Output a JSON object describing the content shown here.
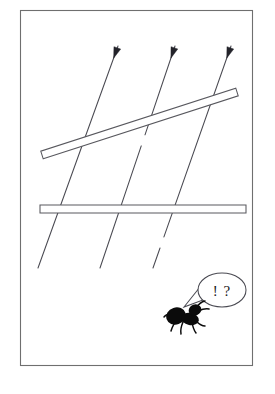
{
  "figure": {
    "background_color": "#ffffff",
    "frame": {
      "name": "illustration-border",
      "x": 20,
      "y": 10,
      "width": 232,
      "height": 355,
      "stroke_color": "#6f6f6f",
      "fill_color": "#ffffff"
    },
    "rays": {
      "count": 3,
      "direction": "down-left",
      "stroke_color": "#4a4a52",
      "arrowhead_color": "#23232a",
      "items": [
        {
          "id": "ray-1",
          "label": "left ray",
          "x1": 118,
          "y1": 46,
          "x2": 38,
          "y2": 268,
          "arrow_at": "start",
          "gaps": []
        },
        {
          "id": "ray-2",
          "label": "middle ray",
          "x1": 175,
          "y1": 46,
          "x2": 100,
          "y2": 268,
          "arrow_at": "start",
          "gaps": [
            {
              "from_t": 0.4,
              "to_t": 0.45
            }
          ]
        },
        {
          "id": "ray-3",
          "label": "right ray",
          "x1": 231,
          "y1": 46,
          "x2": 153,
          "y2": 268,
          "arrow_at": "start",
          "gaps": [
            {
              "from_t": 0.86,
              "to_t": 0.91
            }
          ]
        }
      ]
    },
    "bars": [
      {
        "id": "bar-diagonal",
        "label": "tilted bar",
        "x1": 42,
        "y1": 155,
        "x2": 237,
        "y2": 92,
        "thickness": 8,
        "fill_color": "#ffffff",
        "stroke_color": "#58585e"
      },
      {
        "id": "bar-horizontal",
        "label": "horizontal bar",
        "x1": 40,
        "y1": 209,
        "x2": 246,
        "y2": 209,
        "thickness": 8,
        "fill_color": "#ffffff",
        "stroke_color": "#58585e"
      }
    ],
    "ant": {
      "name": "ant-silhouette",
      "label": "ant",
      "color": "#0b0b0b",
      "x": 186,
      "y": 317,
      "facing": "right"
    },
    "speech_bubble": {
      "name": "speech-bubble",
      "text": "! ?",
      "x": 222,
      "y": 290,
      "rx": 24,
      "ry": 17,
      "fill_color": "#ffffff",
      "stroke_color": "#4a4a52"
    }
  }
}
